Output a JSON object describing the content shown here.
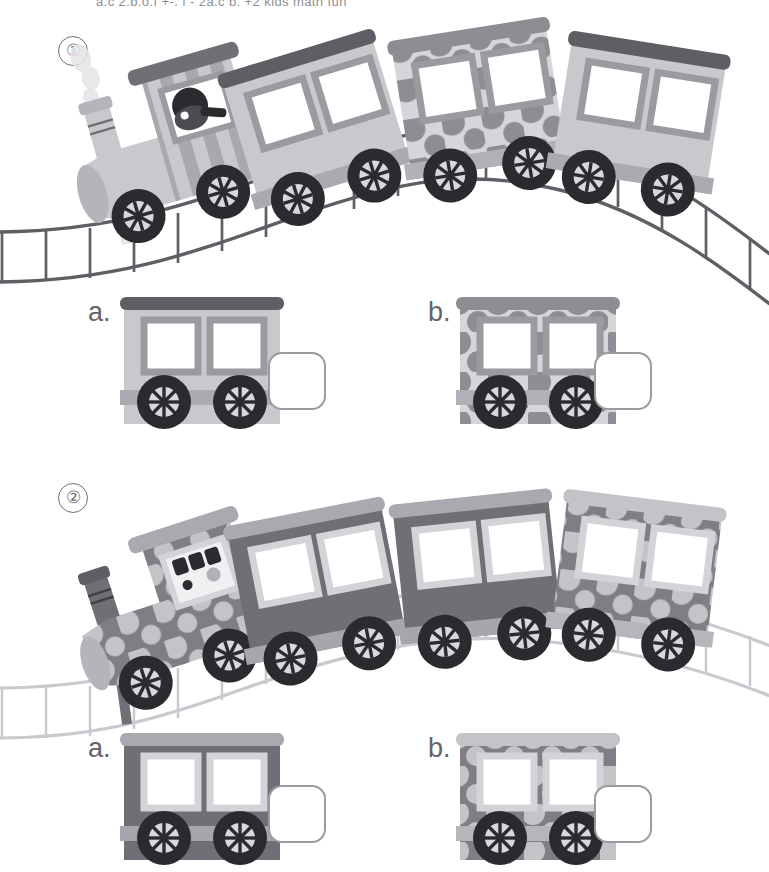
{
  "worksheet": {
    "header_text": "a.c 2.b.o.f  +-, |  - 2a,c b. +2      kids math  fun",
    "page_background": "#ffffff"
  },
  "palette": {
    "light_car_body": "#c9c9cd",
    "light_car_roof": "#5e5e64",
    "light_car_window_frame": "#9a9aa0",
    "light_car_skirt": "#aaaab0",
    "dot_light_base": "#d6d6da",
    "dot_light_dots": "#8d8d93",
    "dark_car_body": "#6f6f75",
    "dark_car_roof": "#a9a9af",
    "dark_car_window_frame": "#d3d3d8",
    "dark_car_skirt": "#a6a6ac",
    "dot_dark_base": "#7e7e84",
    "dot_dark_dots": "#c3c3c8",
    "wheel_tire": "#2b2b2f",
    "wheel_hub": "#d8d8dc",
    "window_glass": "#ffffff",
    "track_dark": "#5e5e64",
    "track_light": "#c9c9cf",
    "checkbox_border": "#9a9aa0",
    "number_circle": "#6f6f75",
    "letter_text": "#636369",
    "smoke": "#e4e4e8",
    "driver_dark": "#2b2b2f"
  },
  "problems": [
    {
      "number": "①",
      "number_label": "1",
      "track_style": "dark",
      "locomotive": {
        "name": "locomotive",
        "body_style": "striped-light",
        "has_driver": true,
        "has_smoke": true,
        "smokestack": true
      },
      "cars": [
        {
          "index": 1,
          "pattern": "plain",
          "shade": "light",
          "windows": 2
        },
        {
          "index": 2,
          "pattern": "dotted",
          "shade": "light",
          "windows": 2
        },
        {
          "index": 3,
          "pattern": "plain",
          "shade": "light",
          "windows": 2
        }
      ],
      "question_prompt": "",
      "options": [
        {
          "letter": "a.",
          "pattern": "plain",
          "shade": "light",
          "windows": 2,
          "checkbox_checked": false,
          "checkbox_value": ""
        },
        {
          "letter": "b.",
          "pattern": "dotted",
          "shade": "light",
          "windows": 2,
          "checkbox_checked": false,
          "checkbox_value": ""
        }
      ]
    },
    {
      "number": "②",
      "number_label": "2",
      "track_style": "light",
      "locomotive": {
        "name": "locomotive",
        "body_style": "dotted-dark",
        "has_driver": true,
        "has_smoke": false,
        "smokestack": true
      },
      "cars": [
        {
          "index": 1,
          "pattern": "plain",
          "shade": "dark",
          "windows": 2
        },
        {
          "index": 2,
          "pattern": "plain",
          "shade": "dark",
          "windows": 2
        },
        {
          "index": 3,
          "pattern": "dotted",
          "shade": "dark",
          "windows": 2
        }
      ],
      "question_prompt": "",
      "options": [
        {
          "letter": "a.",
          "pattern": "plain",
          "shade": "dark",
          "windows": 2,
          "checkbox_checked": false,
          "checkbox_value": ""
        },
        {
          "letter": "b.",
          "pattern": "dotted",
          "shade": "dark",
          "windows": 2,
          "checkbox_checked": false,
          "checkbox_value": ""
        }
      ]
    }
  ]
}
